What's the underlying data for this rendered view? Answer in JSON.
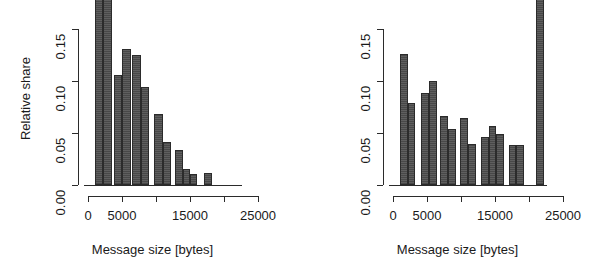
{
  "figure": {
    "background": "#ffffff",
    "bar_fill": "#565656",
    "bar_stroke": "#2b2b2b",
    "axis_color": "#2b2b2b"
  },
  "chart_data": [
    {
      "type": "bar",
      "panel": "left",
      "title": "",
      "xlabel": "Message size [bytes]",
      "ylabel": "Relative share",
      "xlim": [
        -500,
        26500
      ],
      "ylim": [
        0.0,
        0.155
      ],
      "grid": false,
      "legend": null,
      "xticks": [
        0,
        5000,
        15000,
        25000
      ],
      "xticklabels": [
        "0",
        "5000",
        "15000",
        "25000"
      ],
      "yticks": [
        0.0,
        0.05,
        0.1,
        0.15
      ],
      "yticklabels": [
        "0.00",
        "0.05",
        "0.10",
        "0.15"
      ],
      "note": "bar 1 is clipped by the top image edge (value exceeds plotted range)",
      "bin_width": 1250,
      "bin_starts": [
        1000,
        2250,
        3500,
        4750,
        6000,
        7250,
        8500,
        9750,
        11000,
        12250,
        13500,
        14750,
        16000
      ],
      "categories": [
        "1000-2250",
        "2250-3500",
        "3500-4750",
        "4750-6000",
        "6000-7250",
        "7250-8500",
        "8500-9750",
        "9750-11000",
        "11000-12250",
        "12250-13500",
        "13500-14750",
        "14750-16000",
        "16000-17250"
      ],
      "values": [
        0.182,
        0.182,
        0.106,
        0.131,
        0.125,
        0.094,
        0.0,
        0.068,
        0.041,
        0.034,
        0.015,
        0.011,
        0.012
      ]
    },
    {
      "type": "bar",
      "panel": "right",
      "title": "",
      "xlabel": "Message size [bytes]",
      "ylabel": "Relative share",
      "xlim": [
        -500,
        26500
      ],
      "ylim": [
        0.0,
        0.155
      ],
      "grid": false,
      "legend": null,
      "xticks": [
        0,
        5000,
        15000,
        25000
      ],
      "xticklabels": [
        "0",
        "5000",
        "15000",
        "25000"
      ],
      "yticks": [
        0.0,
        0.05,
        0.1,
        0.15
      ],
      "yticklabels": [
        "0.00",
        "0.05",
        "0.10",
        "0.15"
      ],
      "note": "last bar near 21000 bytes is clipped by the top image edge (value exceeds plotted range)",
      "bin_width": 1250,
      "bin_starts": [
        1000,
        2250,
        4000,
        5250,
        6750,
        8000,
        9500,
        10750,
        12500,
        13750,
        15250,
        16500,
        20750
      ],
      "categories": [
        "1000-2250",
        "2250-3500",
        "4000-5250",
        "5250-6500",
        "6750-8000",
        "8000-9250",
        "9500-10750",
        "10750-12000",
        "12500-13750",
        "13750-15000",
        "15250-16500",
        "16500-17750",
        "20750-22000"
      ],
      "values": [
        0.126,
        0.079,
        0.088,
        0.1,
        0.066,
        0.054,
        0.064,
        0.039,
        0.046,
        0.057,
        0.049,
        0.038,
        0.038,
        0.185
      ]
    }
  ],
  "panels": {
    "left": {
      "y_axis_label": "Relative share",
      "x_axis_label": "Message size [bytes]",
      "y_ticks": [
        {
          "label": "0.15",
          "value": 0.15
        },
        {
          "label": "0.10",
          "value": 0.1
        },
        {
          "label": "0.05",
          "value": 0.05
        },
        {
          "label": "0.00",
          "value": 0.0
        }
      ],
      "x_ticks": [
        {
          "label": "0",
          "value": 0
        },
        {
          "label": "5000",
          "value": 5000
        },
        {
          "label": "15000",
          "value": 15000
        },
        {
          "label": "25000",
          "value": 25000
        }
      ],
      "bars": [
        {
          "start": 1000,
          "end": 2250,
          "value": 0.182
        },
        {
          "start": 2250,
          "end": 3500,
          "value": 0.182
        },
        {
          "start": 3750,
          "end": 5000,
          "value": 0.106
        },
        {
          "start": 5000,
          "end": 6250,
          "value": 0.131
        },
        {
          "start": 6500,
          "end": 7750,
          "value": 0.125
        },
        {
          "start": 7750,
          "end": 9000,
          "value": 0.094
        },
        {
          "start": 9750,
          "end": 11000,
          "value": 0.068
        },
        {
          "start": 11000,
          "end": 12250,
          "value": 0.041
        },
        {
          "start": 12750,
          "end": 14000,
          "value": 0.034
        },
        {
          "start": 14000,
          "end": 15000,
          "value": 0.015
        },
        {
          "start": 15000,
          "end": 16000,
          "value": 0.011
        },
        {
          "start": 17000,
          "end": 18250,
          "value": 0.012
        }
      ]
    },
    "right": {
      "y_axis_label": "Relative share",
      "x_axis_label": "Message size [bytes]",
      "y_ticks": [
        {
          "label": "0.15",
          "value": 0.15
        },
        {
          "label": "0.10",
          "value": 0.1
        },
        {
          "label": "0.05",
          "value": 0.05
        },
        {
          "label": "0.00",
          "value": 0.0
        }
      ],
      "x_ticks": [
        {
          "label": "0",
          "value": 0
        },
        {
          "label": "5000",
          "value": 5000
        },
        {
          "label": "15000",
          "value": 15000
        },
        {
          "label": "25000",
          "value": 25000
        }
      ],
      "bars": [
        {
          "start": 1000,
          "end": 2150,
          "value": 0.126
        },
        {
          "start": 2150,
          "end": 3300,
          "value": 0.079
        },
        {
          "start": 4100,
          "end": 5250,
          "value": 0.088
        },
        {
          "start": 5250,
          "end": 6400,
          "value": 0.1
        },
        {
          "start": 6900,
          "end": 8050,
          "value": 0.066
        },
        {
          "start": 8050,
          "end": 9200,
          "value": 0.054
        },
        {
          "start": 9900,
          "end": 11050,
          "value": 0.064
        },
        {
          "start": 11050,
          "end": 12200,
          "value": 0.039
        },
        {
          "start": 12900,
          "end": 14050,
          "value": 0.046
        },
        {
          "start": 14050,
          "end": 15200,
          "value": 0.057
        },
        {
          "start": 15200,
          "end": 16350,
          "value": 0.049
        },
        {
          "start": 17000,
          "end": 18150,
          "value": 0.038
        },
        {
          "start": 18150,
          "end": 19300,
          "value": 0.038
        },
        {
          "start": 21000,
          "end": 22150,
          "value": 0.185
        }
      ]
    }
  }
}
